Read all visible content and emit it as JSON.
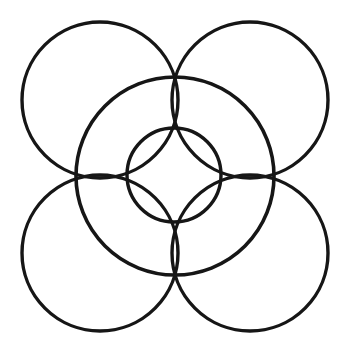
{
  "figure": {
    "type": "line-drawing",
    "canvas": {
      "width": 346,
      "height": 359,
      "background_color": "#ffffff"
    },
    "stroke_color": "#161616",
    "shapes": [
      {
        "name": "outer-circle-top-left",
        "shape": "circle",
        "cx": 100,
        "cy": 100,
        "r": 78,
        "stroke_width": 3.4
      },
      {
        "name": "outer-circle-top-right",
        "shape": "circle",
        "cx": 250,
        "cy": 100,
        "r": 78,
        "stroke_width": 3.4
      },
      {
        "name": "outer-circle-bottom-left",
        "shape": "circle",
        "cx": 100,
        "cy": 253,
        "r": 78,
        "stroke_width": 3.4
      },
      {
        "name": "outer-circle-bottom-right",
        "shape": "circle",
        "cx": 250,
        "cy": 253,
        "r": 78,
        "stroke_width": 3.4
      },
      {
        "name": "medium-circle-center",
        "shape": "circle",
        "cx": 175,
        "cy": 176,
        "r": 99,
        "stroke_width": 3.6
      },
      {
        "name": "inner-circle-center",
        "shape": "circle",
        "cx": 174,
        "cy": 175,
        "r": 47,
        "stroke_width": 3.4
      }
    ],
    "circle_count": 6
  }
}
